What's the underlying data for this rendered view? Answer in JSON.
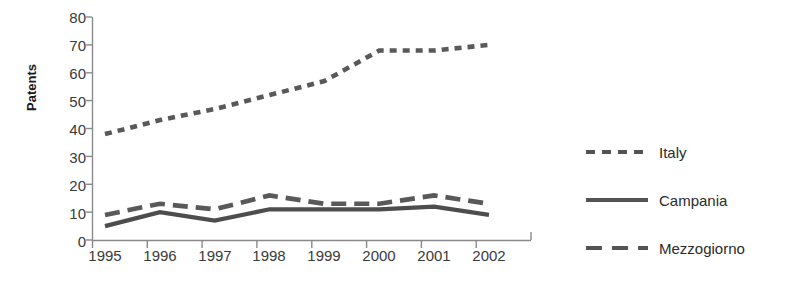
{
  "chart_data": {
    "type": "line",
    "title": "",
    "xlabel": "",
    "ylabel": "Patents",
    "categories": [
      "1995",
      "1996",
      "1997",
      "1998",
      "1999",
      "2000",
      "2001",
      "2002"
    ],
    "x": [
      1995,
      1996,
      1997,
      1998,
      1999,
      2000,
      2001,
      2002
    ],
    "ylim": [
      0,
      80
    ],
    "yticks": [
      "0",
      "10",
      "20",
      "30",
      "40",
      "50",
      "60",
      "70",
      "80"
    ],
    "ytick_values": [
      0,
      10,
      20,
      30,
      40,
      50,
      60,
      70,
      80
    ],
    "grid": false,
    "legend_position": "right",
    "series": [
      {
        "name": "Italy",
        "style": "dotted",
        "color": "#595959",
        "values": [
          38,
          43,
          47,
          52,
          57,
          68,
          68,
          70
        ]
      },
      {
        "name": "Campania",
        "style": "solid",
        "color": "#4d4d4d",
        "values": [
          5,
          10,
          7,
          11,
          11,
          11,
          12,
          9
        ]
      },
      {
        "name": "Mezzogiorno",
        "style": "dashed",
        "color": "#595959",
        "values": [
          9,
          13,
          11,
          16,
          13,
          13,
          16,
          13
        ]
      }
    ]
  },
  "axis": {
    "line_color": "#8a8a8a",
    "tick_label_color": "#3a3a3a"
  },
  "legend": {
    "items": [
      {
        "label": "Italy",
        "swatch": "dotted-line-icon"
      },
      {
        "label": "Campania",
        "swatch": "solid-line-icon"
      },
      {
        "label": "Mezzogiorno",
        "swatch": "dashed-line-icon"
      }
    ]
  }
}
